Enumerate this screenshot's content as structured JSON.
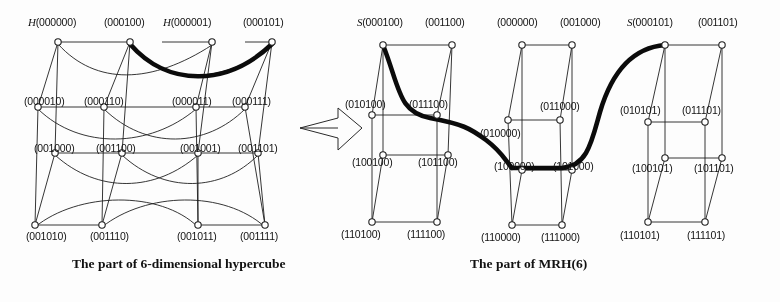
{
  "figure": {
    "title_left": "The part of 6-dimensional hypercube",
    "title_right": "The part of MRH(6)",
    "arrow_icon": "right-arrow-icon",
    "ink_color": "#1a1a1a",
    "node_fill": "#ffffff",
    "highlight_color": "#000000"
  },
  "left_graph": {
    "name": "6-dimensional-hypercube",
    "rows": [
      {
        "row": "top",
        "nodes": [
          {
            "prefix": "H",
            "label": "(000000)"
          },
          {
            "prefix": "",
            "label": "(000100)"
          },
          {
            "prefix": "H",
            "label": "(000001)"
          },
          {
            "prefix": "",
            "label": "(000101)"
          }
        ]
      },
      {
        "row": "upper-middle",
        "nodes": [
          {
            "prefix": "",
            "label": "(000010)"
          },
          {
            "prefix": "",
            "label": "(000110)"
          },
          {
            "prefix": "",
            "label": "(000011)"
          },
          {
            "prefix": "",
            "label": "(000111)"
          }
        ]
      },
      {
        "row": "lower-middle",
        "nodes": [
          {
            "prefix": "",
            "label": "(001000)"
          },
          {
            "prefix": "",
            "label": "(001100)"
          },
          {
            "prefix": "",
            "label": "(001001)"
          },
          {
            "prefix": "",
            "label": "(001101)"
          }
        ]
      },
      {
        "row": "bottom",
        "nodes": [
          {
            "prefix": "",
            "label": "(001010)"
          },
          {
            "prefix": "",
            "label": "(001110)"
          },
          {
            "prefix": "",
            "label": "(001011)"
          },
          {
            "prefix": "",
            "label": "(001111)"
          }
        ]
      }
    ]
  },
  "right_graph": {
    "name": "MRH-6",
    "groups": [
      {
        "group": "left-block",
        "rows": [
          [
            {
              "prefix": "S",
              "label": "(000100)"
            },
            {
              "prefix": "",
              "label": "(001100)"
            }
          ],
          [
            {
              "prefix": "",
              "label": "(010100)"
            },
            {
              "prefix": "",
              "label": "(011100)"
            }
          ],
          [
            {
              "prefix": "",
              "label": "(100100)"
            },
            {
              "prefix": "",
              "label": "(101100)"
            }
          ],
          [
            {
              "prefix": "",
              "label": "(110100)"
            },
            {
              "prefix": "",
              "label": "(111100)"
            }
          ]
        ]
      },
      {
        "group": "middle-block",
        "rows": [
          [
            {
              "prefix": "",
              "label": "(000000)"
            },
            {
              "prefix": "",
              "label": "(001000)"
            }
          ],
          [
            {
              "prefix": "",
              "label": "(010000)"
            },
            {
              "prefix": "",
              "label": "(011000)"
            }
          ],
          [
            {
              "prefix": "",
              "label": "(100000)"
            },
            {
              "prefix": "",
              "label": "(101000)"
            }
          ],
          [
            {
              "prefix": "",
              "label": "(110000)"
            },
            {
              "prefix": "",
              "label": "(111000)"
            }
          ]
        ]
      },
      {
        "group": "right-block",
        "rows": [
          [
            {
              "prefix": "S",
              "label": "(000101)"
            },
            {
              "prefix": "",
              "label": "(001101)"
            }
          ],
          [
            {
              "prefix": "",
              "label": "(010101)"
            },
            {
              "prefix": "",
              "label": "(011101)"
            }
          ],
          [
            {
              "prefix": "",
              "label": "(100101)"
            },
            {
              "prefix": "",
              "label": "(101101)"
            }
          ],
          [
            {
              "prefix": "",
              "label": "(110101)"
            },
            {
              "prefix": "",
              "label": "(111101)"
            }
          ]
        ]
      }
    ]
  }
}
